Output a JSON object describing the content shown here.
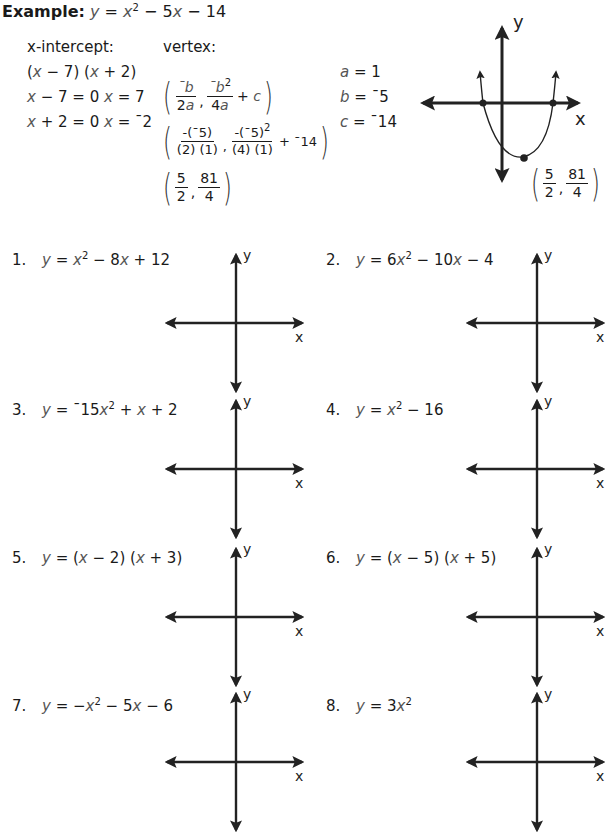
{
  "example": {
    "label": "Example:",
    "equation": {
      "lhs": "y",
      "eq": " = ",
      "x": "x",
      "exp": "2",
      "rest1": " − 5",
      "x2": "x",
      "rest2": " − 14"
    },
    "x_intercept": {
      "heading": "x-intercept:",
      "factored": [
        "(",
        "x",
        " − 7) (",
        "x",
        " + 2)"
      ],
      "line1": {
        "a": "x",
        "b": " − 7 = 0  ",
        "c": "x",
        "d": " = 7"
      },
      "line2": {
        "a": "x",
        "b": " + 2 = 0  ",
        "c": "x",
        "d": " = ˉ2"
      }
    },
    "vertex": {
      "heading": "vertex:",
      "formula": {
        "f1_num": "ˉb",
        "f1_den": "2a",
        "f2_num": "ˉb",
        "f2_exp": "2",
        "f2_den": "4a",
        "tail": "+ c"
      },
      "substituted": {
        "f1_num": "-(ˉ5)",
        "f1_den": "(2) (1)",
        "f2_num": "-(ˉ5)",
        "f2_exp": "2",
        "f2_den": "(4) (1)",
        "tail": "+ ˉ14"
      },
      "result": {
        "x_num": "5",
        "x_den": "2",
        "y_num": "81",
        "y_den": "4"
      }
    },
    "coefficients": [
      {
        "var": "a",
        "eq": " = 1"
      },
      {
        "var": "b",
        "eq": " = ˉ5"
      },
      {
        "var": "c",
        "eq": " = ˉ14"
      }
    ],
    "graph": {
      "x_label": "x",
      "y_label": "y",
      "vertex_label": {
        "x_num": "5",
        "x_den": "2",
        "y_num": "81",
        "y_den": "4"
      }
    }
  },
  "problems": [
    {
      "number": "1.",
      "equation": "y = x² − 8x + 12",
      "x_label": "x",
      "y_label": "y"
    },
    {
      "number": "2.",
      "equation": "y = 6x² − 10x − 4",
      "x_label": "x",
      "y_label": "y"
    },
    {
      "number": "3.",
      "equation": "y = ˉ15x² + x + 2",
      "x_label": "x",
      "y_label": "y"
    },
    {
      "number": "4.",
      "equation": "y = x² − 16",
      "x_label": "x",
      "y_label": "y"
    },
    {
      "number": "5.",
      "equation": "y = (x − 2) (x + 3)",
      "x_label": "x",
      "y_label": "y"
    },
    {
      "number": "6.",
      "equation": "y = (x − 5) (x + 5)",
      "x_label": "x",
      "y_label": "y"
    },
    {
      "number": "7.",
      "equation": "y = −x² − 5x − 6",
      "x_label": "x",
      "y_label": "y"
    },
    {
      "number": "8.",
      "equation": "y = 3x²",
      "x_label": "x",
      "y_label": "y"
    }
  ],
  "problem_parts": [
    [
      {
        "t": "y",
        "i": true
      },
      {
        "t": " = "
      },
      {
        "t": "x",
        "i": true
      },
      {
        "t": "2",
        "s": true
      },
      {
        "t": " − 8"
      },
      {
        "t": "x",
        "i": true
      },
      {
        "t": " + 12"
      }
    ],
    [
      {
        "t": "y",
        "i": true
      },
      {
        "t": " = 6"
      },
      {
        "t": "x",
        "i": true
      },
      {
        "t": "2",
        "s": true
      },
      {
        "t": " − 10"
      },
      {
        "t": "x",
        "i": true
      },
      {
        "t": " − 4"
      }
    ],
    [
      {
        "t": "y",
        "i": true
      },
      {
        "t": " = ˉ15"
      },
      {
        "t": "x",
        "i": true
      },
      {
        "t": "2",
        "s": true
      },
      {
        "t": " + "
      },
      {
        "t": "x",
        "i": true
      },
      {
        "t": " + 2"
      }
    ],
    [
      {
        "t": "y",
        "i": true
      },
      {
        "t": " = "
      },
      {
        "t": "x",
        "i": true
      },
      {
        "t": "2",
        "s": true
      },
      {
        "t": " − 16"
      }
    ],
    [
      {
        "t": "y",
        "i": true
      },
      {
        "t": " = ("
      },
      {
        "t": "x",
        "i": true
      },
      {
        "t": " − 2) ("
      },
      {
        "t": "x",
        "i": true
      },
      {
        "t": " + 3)"
      }
    ],
    [
      {
        "t": "y",
        "i": true
      },
      {
        "t": " = ("
      },
      {
        "t": "x",
        "i": true
      },
      {
        "t": " − 5) ("
      },
      {
        "t": "x",
        "i": true
      },
      {
        "t": " + 5)"
      }
    ],
    [
      {
        "t": "y",
        "i": true
      },
      {
        "t": " = −"
      },
      {
        "t": "x",
        "i": true
      },
      {
        "t": "2",
        "s": true
      },
      {
        "t": " − 5"
      },
      {
        "t": "x",
        "i": true
      },
      {
        "t": " − 6"
      }
    ],
    [
      {
        "t": "y",
        "i": true
      },
      {
        "t": " = 3"
      },
      {
        "t": "x",
        "i": true
      },
      {
        "t": "2",
        "s": true
      }
    ]
  ]
}
